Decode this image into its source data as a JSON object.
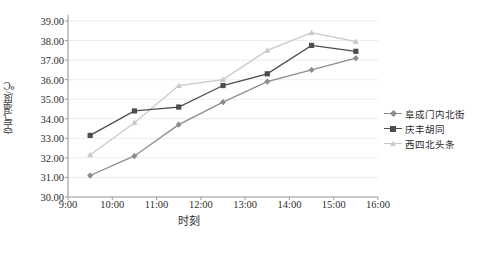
{
  "chart_data": {
    "type": "line",
    "title": "",
    "xlabel": "时刻",
    "ylabel": "空气温度/℃",
    "x": [
      "9:30",
      "10:30",
      "11:30",
      "12:30",
      "13:30",
      "14:30",
      "15:30"
    ],
    "xticklabels": [
      "9:00",
      "10:00",
      "11:00",
      "12:00",
      "13:00",
      "14:00",
      "15:00",
      "16:00"
    ],
    "xtickvalues": [
      9,
      10,
      11,
      12,
      13,
      14,
      15,
      16
    ],
    "xlim": [
      9,
      16
    ],
    "yticklabels": [
      "30.00",
      "31.00",
      "32.00",
      "33.00",
      "34.00",
      "35.00",
      "36.00",
      "37.00",
      "38.00",
      "39.00"
    ],
    "ylim": [
      30.0,
      39.0
    ],
    "grid": true,
    "legend_position": "right",
    "series": [
      {
        "name": "阜成门内北街",
        "color": "#8c8c8c",
        "marker": "diamond",
        "values": [
          31.1,
          32.1,
          33.7,
          34.85,
          35.9,
          36.5,
          37.1
        ]
      },
      {
        "name": "庆丰胡同",
        "color": "#4d4d4d",
        "marker": "square",
        "values": [
          33.15,
          34.4,
          34.6,
          35.7,
          36.3,
          37.75,
          37.45
        ]
      },
      {
        "name": "西四北头条",
        "color": "#c9c9c9",
        "marker": "triangle",
        "values": [
          32.15,
          33.8,
          35.7,
          36.0,
          37.5,
          38.4,
          37.95
        ]
      }
    ]
  },
  "caption": ""
}
